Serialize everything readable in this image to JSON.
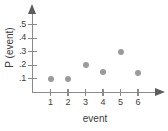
{
  "chart_data": {
    "type": "scatter",
    "title": "",
    "xlabel": "event",
    "ylabel": "P (event)",
    "x": [
      1,
      2,
      3,
      4,
      5,
      6
    ],
    "values": [
      0.1,
      0.1,
      0.2,
      0.15,
      0.3,
      0.14
    ],
    "categories": [
      "1",
      "2",
      "3",
      "4",
      "5",
      "6"
    ],
    "xlim": [
      0,
      6.8
    ],
    "ylim": [
      0,
      0.58
    ],
    "grid": false,
    "legend": "none",
    "marker_color": "#9a9a9a",
    "axis_color": "#8a8a8a",
    "x_ticks": [
      {
        "label": "1",
        "value": 1
      },
      {
        "label": "2",
        "value": 2
      },
      {
        "label": "3",
        "value": 3
      },
      {
        "label": "4",
        "value": 4
      },
      {
        "label": "5",
        "value": 5
      },
      {
        "label": "6",
        "value": 6
      }
    ],
    "y_ticks": [
      {
        "label": ".1",
        "value": 0.1
      },
      {
        "label": ".2",
        "value": 0.2
      },
      {
        "label": ".3",
        "value": 0.3
      },
      {
        "label": ".4",
        "value": 0.4
      },
      {
        "label": ".5",
        "value": 0.5
      }
    ],
    "points": [
      {
        "x": 1,
        "y": 0.1
      },
      {
        "x": 2,
        "y": 0.1
      },
      {
        "x": 3,
        "y": 0.2
      },
      {
        "x": 4,
        "y": 0.15
      },
      {
        "x": 5,
        "y": 0.3
      },
      {
        "x": 6,
        "y": 0.14
      }
    ]
  }
}
